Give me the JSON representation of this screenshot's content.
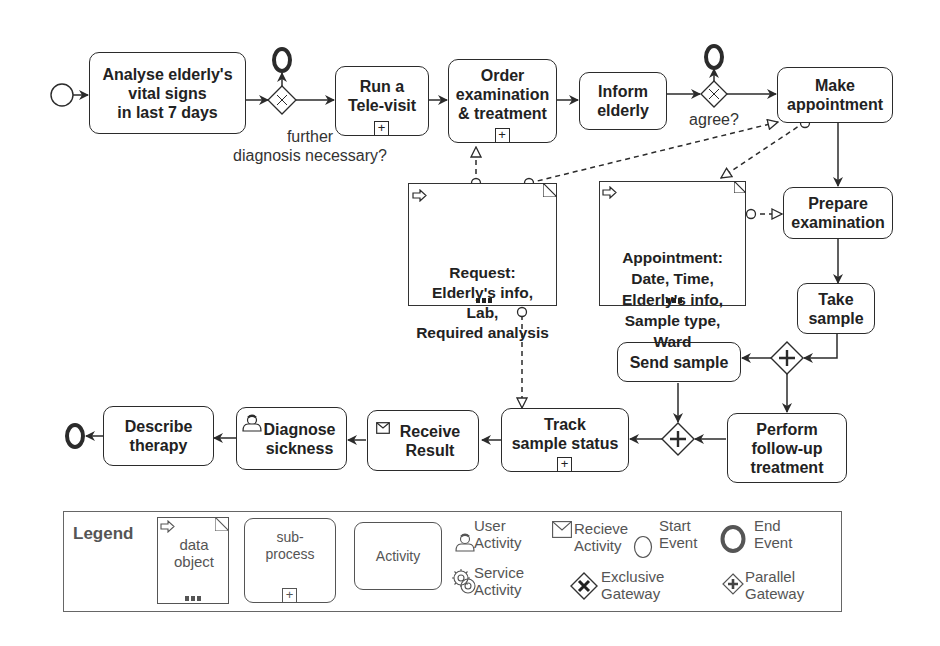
{
  "diagram": {
    "type": "BPMN process",
    "events": {
      "start": {
        "name": "start-event"
      },
      "ends": [
        "end-event-further-diagnosis",
        "end-event-agree",
        "end-event-final"
      ]
    },
    "activities": {
      "analyse": "Analyse elderly's\nvital signs\nin last 7 days",
      "televisit": "Run a\nTele-visit",
      "order": "Order\nexamination\n& treatment",
      "inform": "Inform\nelderly",
      "appointment": "Make\nappointment",
      "prepare": "Prepare\nexamination",
      "take_sample": "Take\nsample",
      "send_sample": "Send sample",
      "followup": "Perform\nfollow-up\ntreatment",
      "track": "Track\nsample status",
      "receive": "Receive\nResult",
      "diagnose": "Diagnose\nsickness",
      "describe": "Describe\ntherapy"
    },
    "gateways": {
      "further_label": "further\ndiagnosis necessary?",
      "agree_label": "agree?"
    },
    "data_objects": {
      "request": "Request:\nElderly's info,\nLab,\nRequired analysis",
      "appointment": "Appointment:\nDate, Time,\nElderly's info,\nSample type,\nWard"
    },
    "subprocess_marker": "+"
  },
  "legend": {
    "title": "Legend",
    "data_object": "data\nobject",
    "sub_process": "sub-\nprocess",
    "activity": "Activity",
    "user_activity": "User\nActivity",
    "receive_activity": "Recieve\nActivity",
    "start_event": "Start\nEvent",
    "end_event": "End\nEvent",
    "service_activity": "Service\nActivity",
    "exclusive_gateway": "Exclusive\nGateway",
    "parallel_gateway": "Parallel\nGateway"
  },
  "colors": {
    "stroke": "#2b2b2b",
    "legend_text": "#555555",
    "background": "#ffffff"
  }
}
